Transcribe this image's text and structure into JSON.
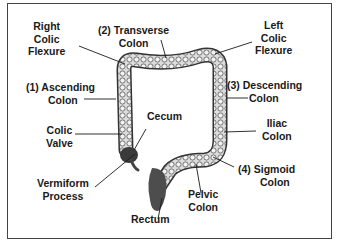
{
  "diagram": {
    "labels": {
      "right_colic_flexure": [
        "Right",
        "Colic",
        "Flexure"
      ],
      "transverse_colon": [
        "(2) Transverse",
        "Colon"
      ],
      "left_colic_flexure": [
        "Left",
        "Colic",
        "Flexure"
      ],
      "ascending_colon": [
        "(1) Ascending",
        "Colon"
      ],
      "descending_colon": [
        "(3) Descending",
        "Colon"
      ],
      "cecum": [
        "Cecum"
      ],
      "colic_valve": [
        "Colic",
        "Valve"
      ],
      "iliac_colon": [
        "Iliac",
        "Colon"
      ],
      "vermiform_process": [
        "Vermiform",
        "Process"
      ],
      "sigmoid_colon": [
        "(4) Sigmoid",
        "Colon"
      ],
      "pelvic_colon": [
        "Pelvic",
        "Colon"
      ],
      "rectum": [
        "Rectum"
      ]
    },
    "colors": {
      "border": "#444444",
      "text": "#1a1a1a",
      "tissue_light": "#d9d9d9",
      "tissue_dark": "#555555"
    }
  }
}
